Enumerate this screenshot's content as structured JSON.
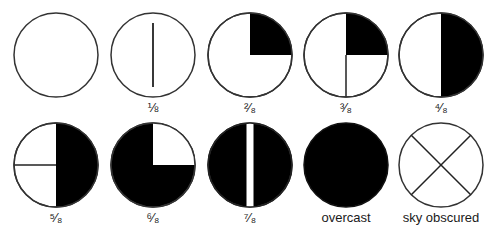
{
  "colors": {
    "fill": "#000000",
    "stroke": "#333333",
    "background": "#ffffff"
  },
  "symbols": [
    {
      "id": "clear",
      "label": "",
      "oktas": 0
    },
    {
      "id": "one-eighth",
      "label": "⅛",
      "oktas": 1
    },
    {
      "id": "two-eighths",
      "label": "²⁄₈",
      "oktas": 2
    },
    {
      "id": "three-eighths",
      "label": "³⁄₈",
      "oktas": 3
    },
    {
      "id": "four-eighths",
      "label": "⁴⁄₈",
      "oktas": 4
    },
    {
      "id": "five-eighths",
      "label": "⁵⁄₈",
      "oktas": 5
    },
    {
      "id": "six-eighths",
      "label": "⁶⁄₈",
      "oktas": 6
    },
    {
      "id": "seven-eighths",
      "label": "⁷⁄₈",
      "oktas": 7
    },
    {
      "id": "overcast",
      "label": "overcast",
      "oktas": 8
    },
    {
      "id": "sky-obscured",
      "label": "sky obscured",
      "oktas": 9
    }
  ]
}
